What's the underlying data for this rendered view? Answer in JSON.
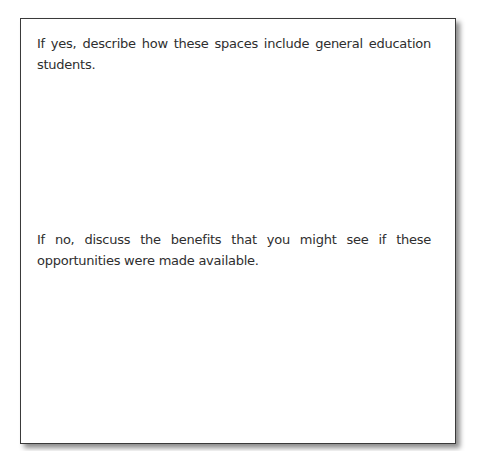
{
  "worksheet": {
    "prompts": [
      {
        "id": "yes",
        "text": "If yes, describe how these spaces include general education students."
      },
      {
        "id": "no",
        "text": "If no, discuss the benefits that you might see if these opportunities were made available."
      }
    ]
  },
  "colors": {
    "border": "#3a3a3a",
    "text": "#2e2e2e",
    "background": "#ffffff"
  }
}
